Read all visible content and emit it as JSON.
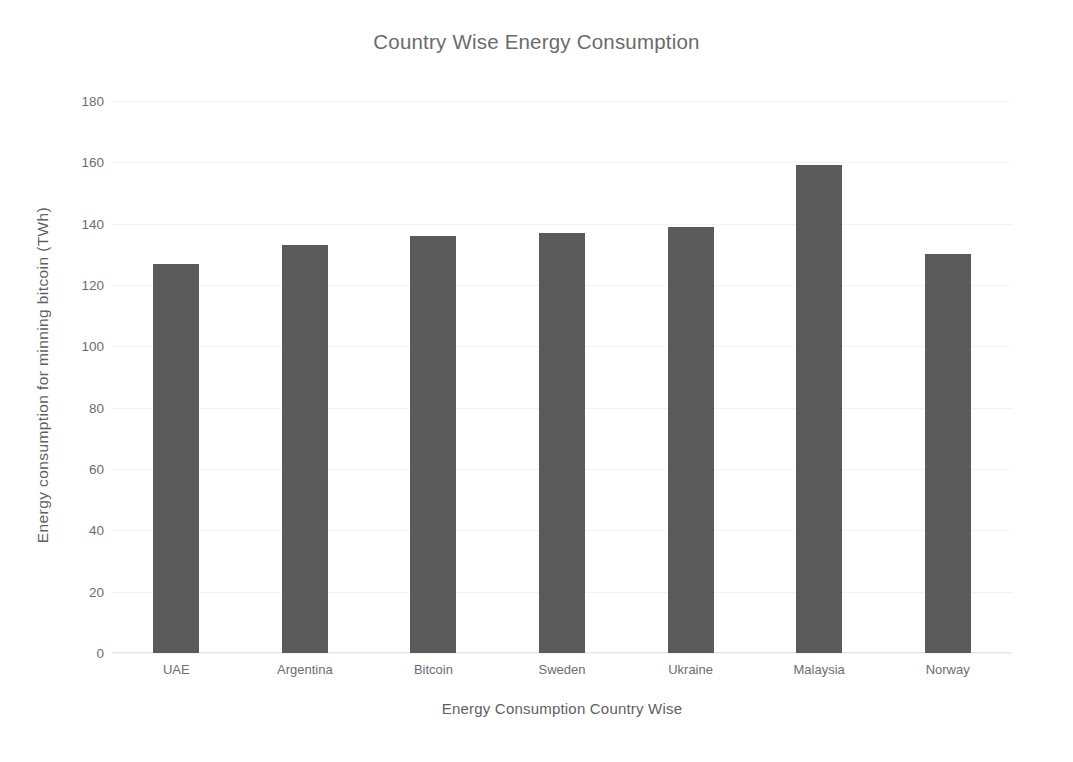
{
  "chart_data": {
    "type": "bar",
    "title": "Country Wise Energy Consumption",
    "xlabel": "Energy Consumption Country Wise",
    "ylabel": "Energy consumption for minning bitcoin (TWh)",
    "categories": [
      "UAE",
      "Argentina",
      "Bitcoin",
      "Sweden",
      "Ukraine",
      "Malaysia",
      "Norway"
    ],
    "values": [
      127,
      133,
      136,
      137,
      139,
      159,
      130
    ],
    "ylim": [
      0,
      180
    ],
    "yticks": [
      0,
      20,
      40,
      60,
      80,
      100,
      120,
      140,
      160,
      180
    ],
    "grid": true,
    "legend": "none",
    "bar_color": "#5a5a5a",
    "text_color": "#6d6d6d"
  }
}
